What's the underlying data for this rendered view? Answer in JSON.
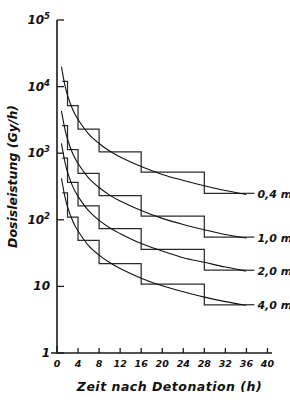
{
  "chart_data": {
    "type": "line",
    "title": "",
    "xlabel": "Zeit nach Detonation (h)",
    "ylabel": "Dosisleistung (Gy/h)",
    "xlim": [
      0,
      42
    ],
    "ylim": [
      1,
      100000
    ],
    "yscale": "log",
    "xscale": "linear",
    "grid": false,
    "legend_position": "right-inline-labels",
    "xticks": [
      0,
      4,
      8,
      12,
      16,
      20,
      24,
      28,
      32,
      36,
      40
    ],
    "xticklabels": [
      "0",
      "4",
      "8",
      "12",
      "16",
      "20",
      "24",
      "28",
      "32",
      "36",
      "40"
    ],
    "yticks": [
      1,
      10,
      100,
      1000,
      10000,
      100000
    ],
    "yticklabels": [
      "1",
      "10",
      "10",
      "10",
      "10",
      "10"
    ],
    "ytick_mantissa": [
      "1",
      "10",
      "10",
      "10",
      "10",
      "10"
    ],
    "ytick_exponents": [
      "",
      "",
      "2",
      "3",
      "4",
      "5"
    ],
    "series": [
      {
        "name": "0,4 m",
        "label": "0,4 m",
        "style": "smooth-decay-curve-with-step-approximation",
        "curve": [
          {
            "x": 0.85,
            "y": 20000
          },
          {
            "x": 1.0,
            "y": 17000
          },
          {
            "x": 1.5,
            "y": 10500
          },
          {
            "x": 2.0,
            "y": 7400
          },
          {
            "x": 3.0,
            "y": 4500
          },
          {
            "x": 4.0,
            "y": 3200
          },
          {
            "x": 6.0,
            "y": 1950
          },
          {
            "x": 8.0,
            "y": 1400
          },
          {
            "x": 10.0,
            "y": 1080
          },
          {
            "x": 12.0,
            "y": 880
          },
          {
            "x": 16.0,
            "y": 630
          },
          {
            "x": 20.0,
            "y": 480
          },
          {
            "x": 24.0,
            "y": 390
          },
          {
            "x": 28.0,
            "y": 325
          },
          {
            "x": 32.0,
            "y": 275
          },
          {
            "x": 36.0,
            "y": 240
          }
        ],
        "steps": [
          {
            "x0": 1,
            "x1": 2,
            "y": 12000
          },
          {
            "x0": 2,
            "x1": 4,
            "y": 5200
          },
          {
            "x0": 4,
            "x1": 8,
            "y": 2300
          },
          {
            "x0": 8,
            "x1": 16,
            "y": 1050
          },
          {
            "x0": 16,
            "x1": 28,
            "y": 520
          },
          {
            "x0": 28,
            "x1": 36,
            "y": 250
          }
        ]
      },
      {
        "name": "1,0 m",
        "label": "1,0 m",
        "style": "smooth-decay-curve-with-step-approximation",
        "curve": [
          {
            "x": 0.85,
            "y": 4300
          },
          {
            "x": 1.0,
            "y": 3700
          },
          {
            "x": 1.5,
            "y": 2300
          },
          {
            "x": 2.0,
            "y": 1620
          },
          {
            "x": 3.0,
            "y": 980
          },
          {
            "x": 4.0,
            "y": 700
          },
          {
            "x": 6.0,
            "y": 425
          },
          {
            "x": 8.0,
            "y": 305
          },
          {
            "x": 10.0,
            "y": 235
          },
          {
            "x": 12.0,
            "y": 192
          },
          {
            "x": 16.0,
            "y": 138
          },
          {
            "x": 20.0,
            "y": 105
          },
          {
            "x": 24.0,
            "y": 85
          },
          {
            "x": 28.0,
            "y": 71
          },
          {
            "x": 32.0,
            "y": 60
          },
          {
            "x": 36.0,
            "y": 53
          }
        ],
        "steps": [
          {
            "x0": 1,
            "x1": 2,
            "y": 2600
          },
          {
            "x0": 2,
            "x1": 4,
            "y": 1130
          },
          {
            "x0": 4,
            "x1": 8,
            "y": 500
          },
          {
            "x0": 8,
            "x1": 16,
            "y": 230
          },
          {
            "x0": 16,
            "x1": 28,
            "y": 114
          },
          {
            "x0": 28,
            "x1": 36,
            "y": 55
          }
        ]
      },
      {
        "name": "2,0 m",
        "label": "2,0 m",
        "style": "smooth-decay-curve-with-step-approximation",
        "curve": [
          {
            "x": 0.85,
            "y": 1400
          },
          {
            "x": 1.0,
            "y": 1200
          },
          {
            "x": 1.5,
            "y": 740
          },
          {
            "x": 2.0,
            "y": 520
          },
          {
            "x": 3.0,
            "y": 315
          },
          {
            "x": 4.0,
            "y": 225
          },
          {
            "x": 6.0,
            "y": 137
          },
          {
            "x": 8.0,
            "y": 98
          },
          {
            "x": 10.0,
            "y": 76
          },
          {
            "x": 12.0,
            "y": 62
          },
          {
            "x": 16.0,
            "y": 44
          },
          {
            "x": 20.0,
            "y": 34
          },
          {
            "x": 24.0,
            "y": 27
          },
          {
            "x": 28.0,
            "y": 23
          },
          {
            "x": 32.0,
            "y": 19.5
          },
          {
            "x": 36.0,
            "y": 17
          }
        ],
        "steps": [
          {
            "x0": 1,
            "x1": 2,
            "y": 840
          },
          {
            "x0": 2,
            "x1": 4,
            "y": 365
          },
          {
            "x0": 4,
            "x1": 8,
            "y": 162
          },
          {
            "x0": 8,
            "x1": 16,
            "y": 74
          },
          {
            "x0": 16,
            "x1": 28,
            "y": 36
          },
          {
            "x0": 28,
            "x1": 36,
            "y": 17.5
          }
        ]
      },
      {
        "name": "4,0 m",
        "label": "4,0 m",
        "style": "smooth-decay-curve-with-step-approximation",
        "curve": [
          {
            "x": 0.85,
            "y": 420
          },
          {
            "x": 1.0,
            "y": 360
          },
          {
            "x": 1.5,
            "y": 222
          },
          {
            "x": 2.0,
            "y": 156
          },
          {
            "x": 3.0,
            "y": 95
          },
          {
            "x": 4.0,
            "y": 68
          },
          {
            "x": 6.0,
            "y": 41
          },
          {
            "x": 8.0,
            "y": 29.5
          },
          {
            "x": 10.0,
            "y": 22.8
          },
          {
            "x": 12.0,
            "y": 18.6
          },
          {
            "x": 16.0,
            "y": 13.3
          },
          {
            "x": 20.0,
            "y": 10.2
          },
          {
            "x": 24.0,
            "y": 8.3
          },
          {
            "x": 28.0,
            "y": 6.9
          },
          {
            "x": 32.0,
            "y": 5.9
          },
          {
            "x": 36.0,
            "y": 5.2
          }
        ],
        "steps": [
          {
            "x0": 1,
            "x1": 2,
            "y": 253
          },
          {
            "x0": 2,
            "x1": 4,
            "y": 110
          },
          {
            "x0": 4,
            "x1": 8,
            "y": 49
          },
          {
            "x0": 8,
            "x1": 16,
            "y": 22
          },
          {
            "x0": 16,
            "x1": 28,
            "y": 10.8
          },
          {
            "x0": 28,
            "x1": 36,
            "y": 5.3
          }
        ]
      }
    ]
  },
  "axis": {
    "x_title": "Zeit nach Detonation (h)",
    "x_title_words": [
      "Zeit",
      "nach",
      "Detonation",
      "(h)"
    ],
    "y_title": "Dosisleistung (Gy/h)"
  }
}
